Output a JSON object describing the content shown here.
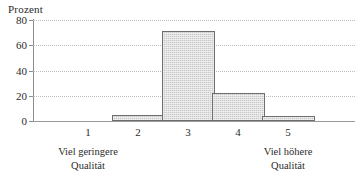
{
  "chart_data": {
    "type": "bar",
    "title": "",
    "ylabel": "Prozent",
    "xlabel": "",
    "categories": [
      "1",
      "2",
      "3",
      "4",
      "5"
    ],
    "values": [
      0,
      5,
      71,
      22,
      4
    ],
    "ylim": [
      0,
      80
    ],
    "yticks": [
      0,
      20,
      40,
      60,
      80
    ],
    "ytick_labels": [
      "0",
      "20",
      "40",
      "60",
      "80"
    ],
    "grid": true,
    "grid_axis": "y",
    "legend": false,
    "annotations": [
      {
        "text_line1": "Viel geringere",
        "text_line2": "Qualität",
        "position": "left-below-axis",
        "anchor_category": "1"
      },
      {
        "text_line1": "Viel höhere",
        "text_line2": "Qualität",
        "position": "right-below-axis",
        "anchor_category": "5"
      }
    ],
    "bar_fill_color": "#c9c9c9",
    "bar_edge_color": "#6e6e6e",
    "grid_color": "#bdbdbd",
    "axis_color": "#8c8c8c",
    "text_color": "#2b2b2b"
  }
}
